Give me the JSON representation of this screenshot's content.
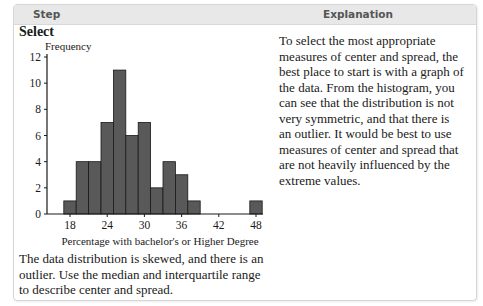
{
  "header": {
    "step_label": "Step",
    "explanation_label": "Explanation"
  },
  "step": {
    "title": "Select",
    "conclusion": "The data distribution is skewed, and there is an outlier. Use the median and interquartile range to describe center and spread."
  },
  "explanation": {
    "text": "To select the most appropriate measures of center and spread, the best place to start is with a graph of the data. From the histogram, you can see that the distribution is not very symmetric, and that there is an outlier. It would be best to use measures of center and spread that are not heavily influenced by the extreme values."
  },
  "chart_data": {
    "type": "bar",
    "title": "",
    "xlabel": "Percentage with bachelor's or Higher Degree",
    "ylabel": "Frequency",
    "bin_width": 2,
    "categories": [
      "17-19",
      "19-21",
      "21-23",
      "23-25",
      "25-27",
      "27-29",
      "29-31",
      "31-33",
      "33-35",
      "35-37",
      "37-39",
      "39-41",
      "41-43",
      "43-45",
      "45-47",
      "47-49"
    ],
    "bin_starts": [
      17,
      19,
      21,
      23,
      25,
      27,
      29,
      31,
      33,
      35,
      37,
      39,
      41,
      43,
      45,
      47
    ],
    "values": [
      1,
      4,
      4,
      7,
      11,
      6,
      7,
      2,
      4,
      3,
      1,
      0,
      0,
      0,
      0,
      1
    ],
    "xticks": [
      18,
      24,
      30,
      36,
      42,
      48
    ],
    "yticks": [
      0,
      2,
      4,
      6,
      8,
      10,
      12
    ],
    "xlim": [
      14,
      49.5
    ],
    "ylim": [
      0,
      12
    ],
    "bar_color": "#595959",
    "grid": false
  }
}
